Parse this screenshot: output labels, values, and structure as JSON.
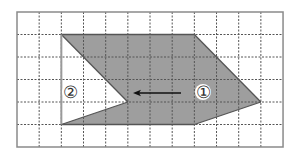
{
  "figure": {
    "type": "grid-translation-diagram",
    "grid": {
      "columns": 12,
      "rows": 6,
      "origin_px": [
        17,
        12
      ],
      "cell_w": 22.17,
      "cell_h": 22.5,
      "line_color": "#555555",
      "border_color": "#8a8a8a"
    },
    "shape_1": {
      "label": "①",
      "fill": "#9e9e9e",
      "stroke": "#555555",
      "vertices_grid": [
        [
          2,
          1
        ],
        [
          8,
          1
        ],
        [
          11,
          4
        ],
        [
          8,
          5
        ],
        [
          2,
          5
        ],
        [
          5,
          4
        ]
      ],
      "label_pos_px": [
        203,
        92
      ]
    },
    "shape_2": {
      "label": "②",
      "vertices_grid": [
        [
          2,
          1
        ],
        [
          5,
          4
        ],
        [
          2,
          5
        ]
      ],
      "outline_color": "#9a9a9a",
      "label_pos_px": [
        70,
        92
      ]
    },
    "arrow": {
      "direction": "left",
      "from_px": [
        181,
        93
      ],
      "to_px": [
        133,
        93
      ],
      "color": "#111111"
    }
  }
}
